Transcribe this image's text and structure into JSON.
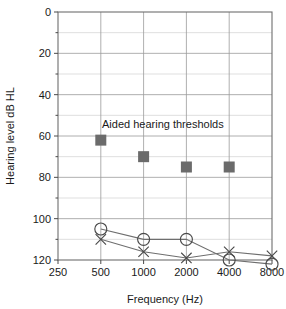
{
  "chart_data": {
    "type": "scatter",
    "title": "",
    "xlabel": "Frequency (Hz)",
    "ylabel": "Hearing level dB HL",
    "xscale": "log",
    "x_tick_labels": [
      "250",
      "500",
      "1000",
      "2000",
      "4000",
      "8000"
    ],
    "x_tick_values": [
      250,
      500,
      1000,
      2000,
      4000,
      8000
    ],
    "xlim": [
      250,
      8000
    ],
    "ylim": [
      0,
      120
    ],
    "y_axis_inverted": true,
    "y_tick_labels": [
      "0",
      "20",
      "40",
      "60",
      "80",
      "100",
      "120"
    ],
    "y_tick_values": [
      0,
      20,
      40,
      60,
      80,
      100,
      120
    ],
    "y_minor_tick_values": [
      10,
      30,
      50,
      70,
      90,
      110
    ],
    "grid": true,
    "legend_position": "none",
    "annotations": [
      {
        "text": "Aided hearing thresholds",
        "x": 700,
        "y": 55
      }
    ],
    "series": [
      {
        "name": "Aided hearing thresholds",
        "marker": "square",
        "color": "#6b6b6b",
        "line": false,
        "x": [
          500,
          1000,
          2000,
          4000
        ],
        "values": [
          62,
          70,
          75,
          75
        ]
      },
      {
        "name": "Unaided right ear",
        "marker": "circle",
        "color": "#4a4a4a",
        "line": true,
        "x": [
          500,
          1000,
          2000,
          4000,
          8000
        ],
        "values": [
          105,
          110,
          110,
          120,
          122
        ]
      },
      {
        "name": "Unaided left ear",
        "marker": "cross",
        "color": "#4a4a4a",
        "line": true,
        "x": [
          500,
          1000,
          2000,
          4000,
          8000
        ],
        "values": [
          110,
          116,
          119,
          116,
          118
        ]
      }
    ]
  }
}
